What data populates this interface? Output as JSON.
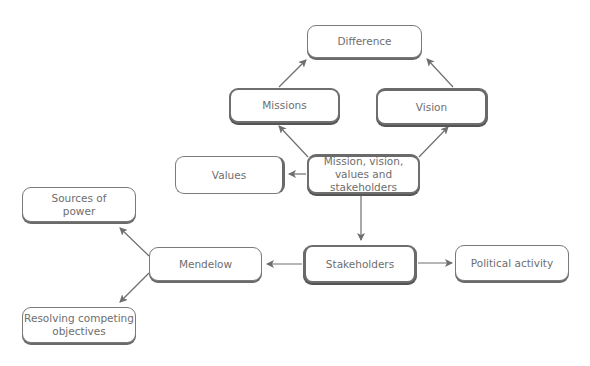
{
  "diagram": {
    "nodes": {
      "difference": {
        "label": "Difference"
      },
      "missions": {
        "label": "Missions"
      },
      "vision": {
        "label": "Vision"
      },
      "center": {
        "line1": "Mission, vision,",
        "line2": "values and stakeholders"
      },
      "values": {
        "label": "Values"
      },
      "stakeholders": {
        "label": "Stakeholders"
      },
      "political": {
        "label": "Political activity"
      },
      "mendelow": {
        "label": "Mendelow"
      },
      "sources": {
        "line1": "Sources of",
        "line2": "power"
      },
      "resolving": {
        "line1": "Resolving competing",
        "line2": "objectives"
      }
    },
    "edges": [
      {
        "from": "Missions",
        "to": "Difference"
      },
      {
        "from": "Vision",
        "to": "Difference"
      },
      {
        "from": "Mission, vision, values and stakeholders",
        "to": "Missions"
      },
      {
        "from": "Mission, vision, values and stakeholders",
        "to": "Vision"
      },
      {
        "from": "Mission, vision, values and stakeholders",
        "to": "Values"
      },
      {
        "from": "Mission, vision, values and stakeholders",
        "to": "Stakeholders"
      },
      {
        "from": "Stakeholders",
        "to": "Political activity"
      },
      {
        "from": "Stakeholders",
        "to": "Mendelow"
      },
      {
        "from": "Mendelow",
        "to": "Sources of power"
      },
      {
        "from": "Mendelow",
        "to": "Resolving competing objectives"
      }
    ],
    "colors": {
      "line": "#6e6e6e",
      "text": "#6e6e6e",
      "border": "#7a7a7a"
    }
  }
}
